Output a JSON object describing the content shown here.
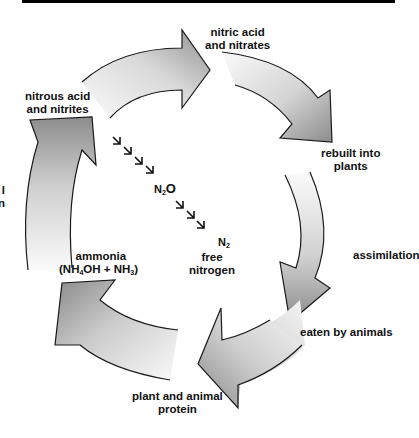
{
  "diagram": {
    "type": "cycle",
    "title_bar": "",
    "nodes": {
      "nitric_acid": [
        "nitric acid",
        "and nitrates"
      ],
      "rebuilt": [
        "rebuilt into",
        "plants"
      ],
      "assimilation": "assimilation",
      "eaten": "eaten by animals",
      "protein": [
        "plant and animal",
        "protein"
      ],
      "ammonia": {
        "line1": "ammonia",
        "line2_parts": [
          "(NH",
          "4",
          "OH + NH",
          "3",
          ")"
        ]
      },
      "nitrous_acid": [
        "nitrous acid",
        "and nitrites"
      ],
      "n2o": {
        "base": "N",
        "sub": "2",
        "tail": "O"
      },
      "n2": {
        "base": "N",
        "sub": "2"
      },
      "free_nitrogen": [
        "free",
        "nitrogen"
      ],
      "cut_off_left": [
        "l",
        "n"
      ]
    },
    "colors": {
      "arrow_dark": "#8e8e8e",
      "arrow_light": "#f4f4f4",
      "outline": "#1a1a1a"
    }
  }
}
